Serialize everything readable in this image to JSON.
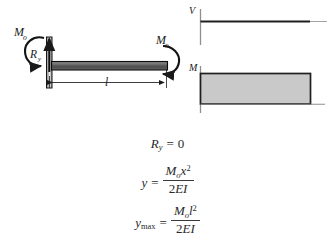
{
  "figure": {
    "beam_diagram": {
      "name": "cantilever-beam-with-end-moment",
      "labels": {
        "applied_moment_left": "M",
        "applied_moment_left_sub": "o",
        "applied_moment_right": "M",
        "applied_moment_right_sub": "o",
        "reaction_vertical": "R",
        "reaction_vertical_sub": "y",
        "length": "l"
      },
      "colors": {
        "beam_fill": "#6b6b6b",
        "beam_outline": "#111111",
        "wall_fill": "#9a9a9a",
        "wall_outline": "#111111",
        "arrow": "#1a1a1a",
        "dimension_line": "#1a1a1a"
      }
    },
    "shear_moment_diagram": {
      "name": "shear-and-moment-diagrams",
      "shear": {
        "axis_label": "V",
        "value": 0,
        "description": "zero shear along entire span"
      },
      "moment": {
        "axis_label": "M",
        "value_label": "Mo",
        "description": "constant positive moment along entire span"
      },
      "colors": {
        "axis": "#8a8a8a",
        "curve": "#1f1f1f",
        "moment_fill": "#c9c9c9",
        "moment_outline": "#1f1f1f",
        "baseline": "#8a8a8a"
      }
    }
  },
  "equations": [
    {
      "id": "reaction",
      "name": "equation-reaction",
      "lhs_var": "R",
      "lhs_sub": "y",
      "operator": "=",
      "rhs": "0",
      "plain": "R_y = 0"
    },
    {
      "id": "deflection",
      "name": "equation-deflection",
      "lhs_var": "y",
      "operator": "=",
      "numerator_var1": "M",
      "numerator_sub1": "o",
      "numerator_var2": "x",
      "numerator_sup2": "2",
      "denominator_coeff": "2",
      "denominator_vars": "EI",
      "plain": "y = M_o x^2 / (2EI)"
    },
    {
      "id": "max-deflection",
      "name": "equation-max-deflection",
      "lhs_var": "y",
      "lhs_sub": "max",
      "operator": "=",
      "numerator_var1": "M",
      "numerator_sub1": "o",
      "numerator_var2": "l",
      "numerator_sup2": "2",
      "denominator_coeff": "2",
      "denominator_vars": "EI",
      "plain": "y_max = M_o l^2 / (2EI)"
    }
  ],
  "page": {
    "background_color": "#ffffff",
    "width": 335,
    "height": 241
  }
}
